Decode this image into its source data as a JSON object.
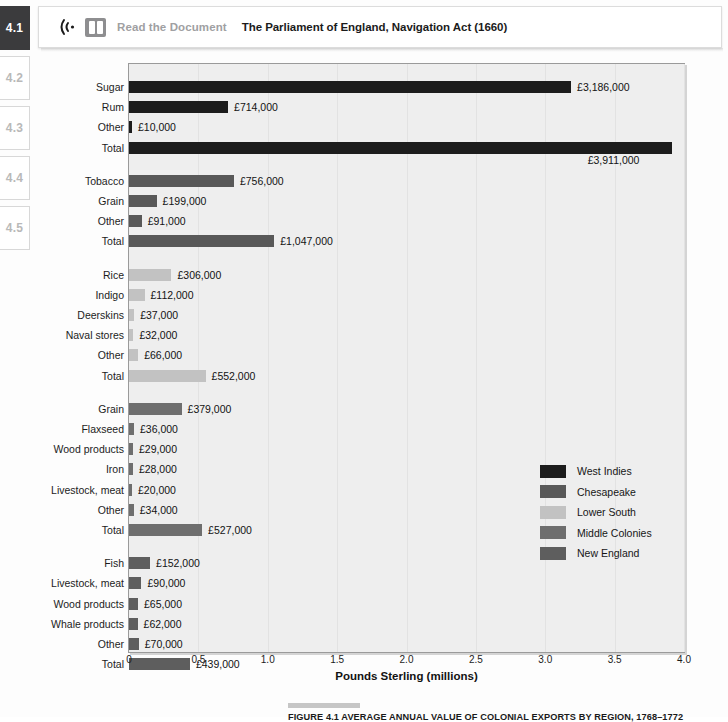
{
  "sidebar": {
    "items": [
      {
        "label": "4.1",
        "active": true
      },
      {
        "label": "4.2",
        "active": false
      },
      {
        "label": "4.3",
        "active": false
      },
      {
        "label": "4.4",
        "active": false
      },
      {
        "label": "4.5",
        "active": false
      }
    ]
  },
  "header": {
    "audio_icon": "audio-waves-icon",
    "book_icon": "open-book-icon",
    "read_label": "Read the Document",
    "document_title": "The Parliament of England, Navigation Act (1660)"
  },
  "caption": {
    "figure_label": "FIGURE 4.1",
    "text": "FIGURE 4.1   AVERAGE ANNUAL VALUE OF COLONIAL EXPORTS BY REGION, 1768–1772"
  },
  "chart_data": {
    "type": "bar",
    "orientation": "horizontal",
    "xlabel": "Pounds Sterling (millions)",
    "ylabel": "",
    "xlim": [
      0,
      4.0
    ],
    "xticks": [
      "0",
      "0.5",
      "1.0",
      "1.5",
      "2.0",
      "2.5",
      "3.0",
      "3.5",
      "4.0"
    ],
    "xtick_values": [
      0,
      0.5,
      1.0,
      1.5,
      2.0,
      2.5,
      3.0,
      3.5,
      4.0
    ],
    "grid": "vertical",
    "legend_position": "middle-right",
    "units": "pounds sterling",
    "value_label_prefix": "£",
    "legend": [
      {
        "name": "West Indies",
        "color": "#1c1c1c"
      },
      {
        "name": "Chesapeake",
        "color": "#585858"
      },
      {
        "name": "Lower South",
        "color": "#c2c2c2"
      },
      {
        "name": "Middle Colonies",
        "color": "#6e6e6e"
      },
      {
        "name": "New England",
        "color": "#5e5e5e"
      }
    ],
    "groups": [
      {
        "region": "West Indies",
        "color": "#1c1c1c",
        "bars": [
          {
            "label": "Sugar",
            "value": 3186000,
            "value_label": "£3,186,000"
          },
          {
            "label": "Rum",
            "value": 714000,
            "value_label": "£714,000"
          },
          {
            "label": "Other",
            "value": 10000,
            "value_label": "£10,000"
          },
          {
            "label": "Total",
            "value": 3911000,
            "value_label": "£3,911,000",
            "label_below": true
          }
        ]
      },
      {
        "region": "Chesapeake",
        "color": "#585858",
        "bars": [
          {
            "label": "Tobacco",
            "value": 756000,
            "value_label": "£756,000"
          },
          {
            "label": "Grain",
            "value": 199000,
            "value_label": "£199,000"
          },
          {
            "label": "Other",
            "value": 91000,
            "value_label": "£91,000"
          },
          {
            "label": "Total",
            "value": 1047000,
            "value_label": "£1,047,000"
          }
        ]
      },
      {
        "region": "Lower South",
        "color": "#c2c2c2",
        "bars": [
          {
            "label": "Rice",
            "value": 306000,
            "value_label": "£306,000"
          },
          {
            "label": "Indigo",
            "value": 112000,
            "value_label": "£112,000"
          },
          {
            "label": "Deerskins",
            "value": 37000,
            "value_label": "£37,000"
          },
          {
            "label": "Naval stores",
            "value": 32000,
            "value_label": "£32,000"
          },
          {
            "label": "Other",
            "value": 66000,
            "value_label": "£66,000"
          },
          {
            "label": "Total",
            "value": 552000,
            "value_label": "£552,000"
          }
        ]
      },
      {
        "region": "Middle Colonies",
        "color": "#6e6e6e",
        "bars": [
          {
            "label": "Grain",
            "value": 379000,
            "value_label": "£379,000"
          },
          {
            "label": "Flaxseed",
            "value": 36000,
            "value_label": "£36,000"
          },
          {
            "label": "Wood products",
            "value": 29000,
            "value_label": "£29,000"
          },
          {
            "label": "Iron",
            "value": 28000,
            "value_label": "£28,000"
          },
          {
            "label": "Livestock, meat",
            "value": 20000,
            "value_label": "£20,000"
          },
          {
            "label": "Other",
            "value": 34000,
            "value_label": "£34,000"
          },
          {
            "label": "Total",
            "value": 527000,
            "value_label": "£527,000"
          }
        ]
      },
      {
        "region": "New England",
        "color": "#5e5e5e",
        "bars": [
          {
            "label": "Fish",
            "value": 152000,
            "value_label": "£152,000"
          },
          {
            "label": "Livestock, meat",
            "value": 90000,
            "value_label": "£90,000"
          },
          {
            "label": "Wood products",
            "value": 65000,
            "value_label": "£65,000"
          },
          {
            "label": "Whale products",
            "value": 62000,
            "value_label": "£62,000"
          },
          {
            "label": "Other",
            "value": 70000,
            "value_label": "£70,000"
          },
          {
            "label": "Total",
            "value": 439000,
            "value_label": "£439,000"
          }
        ]
      }
    ]
  }
}
